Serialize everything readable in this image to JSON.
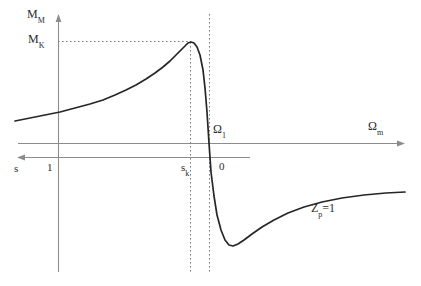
{
  "figure": {
    "background_color": "#ffffff",
    "curve_color": "#262626",
    "axis_color": "#8c8c8c",
    "dotted_color": "#8c8c8c",
    "text_color": "#2b2b2b"
  },
  "labels": {
    "torque_axis": {
      "base": "M",
      "sub": "M"
    },
    "breakdown_torque": {
      "base": "M",
      "sub": "K"
    },
    "speed_axis": {
      "base": "Ω",
      "sub": "m"
    },
    "sync_speed": {
      "base": "Ω",
      "sub": "1"
    },
    "slip_axis": {
      "base": "s",
      "sub": ""
    },
    "slip_one": "1",
    "slip_breakdown": {
      "base": "s",
      "sub": "k"
    },
    "slip_zero": "0",
    "impedance_note": {
      "base": "Z",
      "sub": "p",
      "tail": "=1"
    }
  },
  "chart_data": {
    "type": "line",
    "title": "",
    "xlabel": "Ωm",
    "ylabel": "MM",
    "legend": [],
    "grid": false,
    "annotations": [
      {
        "name": "breakdown-torque-level",
        "label": "MK",
        "type": "horizontal-dotted",
        "y_px": 41,
        "x_start_px": 58,
        "x_end_px": 190
      },
      {
        "name": "breakdown-slip-line",
        "label": "sk",
        "type": "vertical-dotted",
        "x_px": 190,
        "y_start_px": 41,
        "y_end_px": 272
      },
      {
        "name": "synchronous-speed-line",
        "label": "Ω1",
        "type": "vertical-dotted",
        "x_px": 209,
        "y_start_px": 14,
        "y_end_px": 272
      },
      {
        "name": "rotor-impedance-note",
        "label": "Zp=1",
        "type": "text",
        "x_px": 311,
        "y_px": 202
      }
    ],
    "axes": {
      "torque_axis": {
        "name": "MM",
        "orientation": "vertical",
        "x_px": 58,
        "y_top_px": 15,
        "y_bottom_px": 272,
        "arrow": "up"
      },
      "speed_axis": {
        "name": "Ωm",
        "orientation": "horizontal",
        "y_px": 143,
        "x_start_px": 18,
        "x_end_px": 405,
        "arrow": "right"
      },
      "slip_axis": {
        "name": "s",
        "orientation": "horizontal",
        "y_px": 157,
        "x_start_px": 250,
        "x_end_px": 18,
        "arrow": "left",
        "ticks": [
          {
            "label": "s",
            "x_px": 18
          },
          {
            "label": "1",
            "x_px": 58
          },
          {
            "label": "sk",
            "x_px": 190
          },
          {
            "label": "0",
            "x_px": 215
          }
        ]
      }
    },
    "curve_points_px": [
      [
        15,
        121
      ],
      [
        30,
        118
      ],
      [
        45,
        115
      ],
      [
        60,
        112
      ],
      [
        75,
        108
      ],
      [
        90,
        104
      ],
      [
        103,
        100
      ],
      [
        115,
        95
      ],
      [
        126,
        90
      ],
      [
        136,
        85
      ],
      [
        146,
        79
      ],
      [
        155,
        73
      ],
      [
        163,
        67
      ],
      [
        170,
        61
      ],
      [
        176,
        55
      ],
      [
        181,
        50
      ],
      [
        185,
        46
      ],
      [
        188,
        43
      ],
      [
        191,
        42
      ],
      [
        194,
        43
      ],
      [
        197,
        47
      ],
      [
        200,
        55
      ],
      [
        203,
        70
      ],
      [
        205,
        88
      ],
      [
        207,
        112
      ],
      [
        209,
        143
      ],
      [
        211,
        172
      ],
      [
        214,
        196
      ],
      [
        217,
        215
      ],
      [
        221,
        230
      ],
      [
        225,
        240
      ],
      [
        229,
        245
      ],
      [
        233,
        246
      ],
      [
        238,
        244
      ],
      [
        244,
        240
      ],
      [
        252,
        234
      ],
      [
        262,
        227
      ],
      [
        274,
        220
      ],
      [
        288,
        213
      ],
      [
        304,
        207
      ],
      [
        322,
        202
      ],
      [
        342,
        198
      ],
      [
        364,
        195
      ],
      [
        386,
        193
      ],
      [
        405,
        192
      ]
    ]
  }
}
